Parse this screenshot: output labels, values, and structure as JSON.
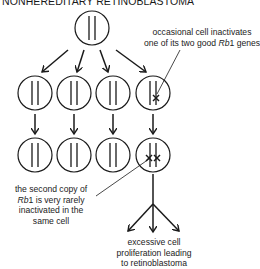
{
  "title": "NONHEREDITARY RETINOBLASTOMA",
  "annotations": {
    "first_hit": {
      "line1": "occasional cell inactivates",
      "line2_prefix": "one of its two good ",
      "gene": "Rb",
      "gene_suffix": "1 genes"
    },
    "second_hit": {
      "line1": "the second copy of",
      "gene": "Rb",
      "line2_suffix": "1 is very rarely",
      "line3": "inactivated in the",
      "line4": "same cell"
    },
    "outcome": {
      "line1": "excessive cell",
      "line2": "proliferation leading",
      "line3": "to retinoblastoma"
    }
  },
  "cells": {
    "root": {
      "label": "normal cell",
      "mutations": 0
    },
    "generation_1": [
      {
        "mutations": 0
      },
      {
        "mutations": 0
      },
      {
        "mutations": 0
      },
      {
        "mutations": 1
      }
    ],
    "generation_2": [
      {
        "mutations": 0
      },
      {
        "mutations": 0
      },
      {
        "mutations": 0
      },
      {
        "mutations": 2
      }
    ]
  },
  "colors": {
    "stroke": "#1a1a1a",
    "background": "#ffffff"
  }
}
